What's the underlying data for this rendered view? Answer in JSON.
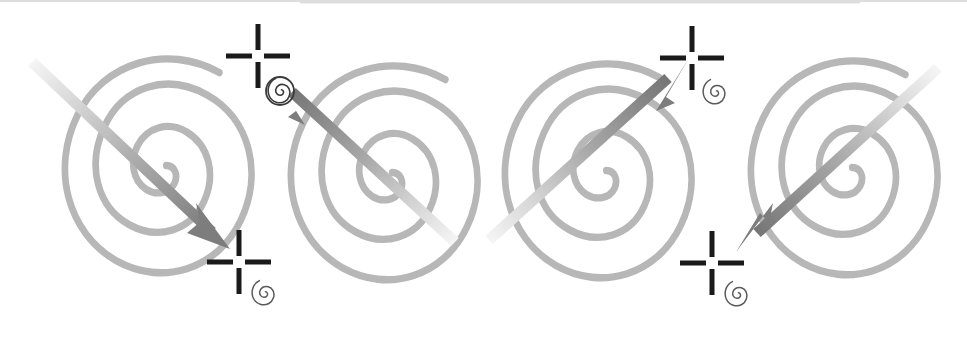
{
  "figure": {
    "title": "Four spiral targets with directional arrows and crosshair registration marks",
    "background_color": "#ffffff",
    "width": 967,
    "height": 340,
    "top_edge_line_color": "#c8c8c8"
  },
  "palette": {
    "spiral_stroke": "#b7b7b7",
    "spiral_stroke_alt": "#bdbdbd",
    "arrow_light": "#f2f2f2",
    "arrow_mid": "#b0b0b0",
    "arrow_dark": "#7d7d7d",
    "crosshair_black": "#1a1a1a",
    "glyph_gray": "#555555"
  },
  "chart_data": {
    "type": "scatter",
    "title": "Four spiral targets with directional arrows and crosshair registration marks",
    "xlabel": "",
    "ylabel": "",
    "xlim": [
      0,
      967
    ],
    "ylim": [
      0,
      340
    ],
    "grid": false,
    "legend": "none",
    "series": [
      {
        "name": "spirals",
        "values": [
          {
            "id": "spiral-1",
            "cx": 152,
            "cy": 170,
            "rx_outer": 96,
            "ry_outer": 108,
            "turns": 2.6,
            "stroke": "#b7b7b7",
            "stroke_width": 7
          },
          {
            "id": "spiral-2",
            "cx": 378,
            "cy": 177,
            "rx_outer": 96,
            "ry_outer": 108,
            "turns": 2.6,
            "stroke": "#b7b7b7",
            "stroke_width": 7
          },
          {
            "id": "spiral-3",
            "cx": 592,
            "cy": 175,
            "rx_outer": 96,
            "ry_outer": 108,
            "turns": 2.6,
            "stroke": "#b7b7b7",
            "stroke_width": 7
          },
          {
            "id": "spiral-4",
            "cx": 838,
            "cy": 172,
            "rx_outer": 96,
            "ry_outer": 108,
            "turns": 2.6,
            "stroke": "#b7b7b7",
            "stroke_width": 7
          }
        ]
      },
      {
        "name": "arrows",
        "values": [
          {
            "id": "arrow-1",
            "direction": "down-right",
            "x1": 32,
            "y1": 62,
            "x2": 228,
            "y2": 247,
            "tail_color": "#f2f2f2",
            "head_color": "#7d7d7d"
          },
          {
            "id": "arrow-2",
            "direction": "up-left",
            "x1": 455,
            "y1": 242,
            "x2": 275,
            "y2": 76,
            "tail_color": "#f2f2f2",
            "head_color": "#7d7d7d"
          },
          {
            "id": "arrow-3",
            "direction": "up-right",
            "x1": 489,
            "y1": 240,
            "x2": 685,
            "y2": 60,
            "tail_color": "#f2f2f2",
            "head_color": "#7d7d7d"
          },
          {
            "id": "arrow-4",
            "direction": "down-left",
            "x1": 938,
            "y1": 68,
            "x2": 738,
            "y2": 248,
            "tail_color": "#f2f2f2",
            "head_color": "#7d7d7d"
          }
        ]
      },
      {
        "name": "crosshairs",
        "values": [
          {
            "id": "crosshair-1",
            "cx": 239,
            "cy": 262,
            "arm": 26,
            "gap": 6,
            "thickness": 5
          },
          {
            "id": "crosshair-2",
            "cx": 258,
            "cy": 56,
            "arm": 26,
            "gap": 6,
            "thickness": 5
          },
          {
            "id": "crosshair-3",
            "cx": 692,
            "cy": 58,
            "arm": 26,
            "gap": 6,
            "thickness": 5
          },
          {
            "id": "crosshair-4",
            "cx": 712,
            "cy": 263,
            "arm": 26,
            "gap": 6,
            "thickness": 5
          }
        ]
      },
      {
        "name": "spiral_glyphs",
        "values": [
          {
            "id": "glyph-1",
            "cx": 264,
            "cy": 293,
            "r": 13,
            "circled": false
          },
          {
            "id": "glyph-2",
            "cx": 280,
            "cy": 91,
            "r": 13,
            "circled": true
          },
          {
            "id": "glyph-3",
            "cx": 715,
            "cy": 92,
            "r": 13,
            "circled": false
          },
          {
            "id": "glyph-4",
            "cx": 737,
            "cy": 294,
            "r": 13,
            "circled": false
          }
        ]
      }
    ]
  },
  "labels": {
    "panel_1": "Panel 1 — spiral with arrow pointing down-right",
    "panel_2": "Panel 2 — spiral with arrow pointing up-left",
    "panel_3": "Panel 3 — spiral with arrow pointing up-right",
    "panel_4": "Panel 4 — spiral with arrow pointing down-left"
  }
}
